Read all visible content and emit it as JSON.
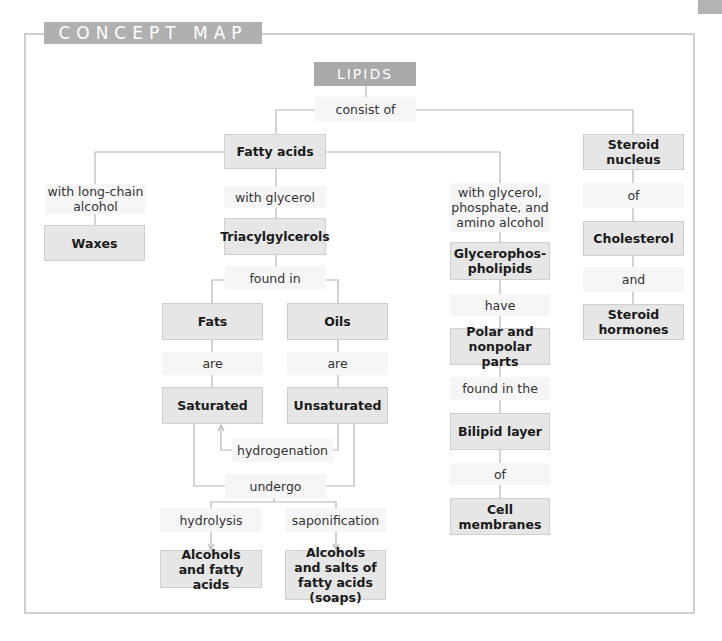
{
  "header": {
    "title": "CONCEPT MAP"
  },
  "colors": {
    "header_tab": "#b0b0b0",
    "root_box": "#a9a9a9",
    "concept_box": "#e6e6e6",
    "link_label": "#f6f6f6",
    "frame": "#cfcfcf",
    "connector": "#b5b5b5"
  },
  "root": {
    "label": "LIPIDS"
  },
  "links": {
    "consist_of": "consist of",
    "with_long_chain_alcohol": "with long-chain alcohol",
    "with_glycerol": "with glycerol",
    "with_glycerol_phosphate": "with glycerol, phosphate, and amino alcohol",
    "steroid_of": "of",
    "found_in": "found in",
    "fats_are": "are",
    "oils_are": "are",
    "hydrogenation": "hydrogenation",
    "undergo": "undergo",
    "hydrolysis": "hydrolysis",
    "saponification": "saponification",
    "have": "have",
    "found_in_the": "found in the",
    "bilipid_of": "of",
    "and": "and"
  },
  "concepts": {
    "fatty_acids": "Fatty acids",
    "steroid_nucleus": "Steroid nucleus",
    "waxes": "Waxes",
    "triacylglycerols": "Triacylgylcerols",
    "fats": "Fats",
    "oils": "Oils",
    "saturated": "Saturated",
    "unsaturated": "Unsaturated",
    "alcohols_fatty_acids": "Alcohols and fatty acids",
    "alcohols_salts": "Alcohols and salts of fatty acids (soaps)",
    "glycerophospholipids": "Glycerophos-pholipids",
    "polar_nonpolar": "Polar and nonpolar parts",
    "bilipid_layer": "Bilipid layer",
    "cell_membranes": "Cell membranes",
    "cholesterol": "Cholesterol",
    "steroid_hormones": "Steroid hormones"
  }
}
